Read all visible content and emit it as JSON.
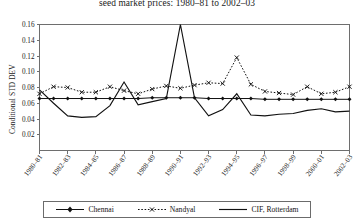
{
  "chart_data": {
    "type": "line",
    "title": "seed market prices: 1980–81 to 2002–03",
    "title_note": "top line of title cropped above image edge",
    "xlabel": "",
    "ylabel": "Conditional STD DEV",
    "ylim": [
      0.0,
      0.16
    ],
    "yticks": [
      0.02,
      0.04,
      0.06,
      0.08,
      0.1,
      0.12,
      0.14,
      0.16
    ],
    "ytick_labels": [
      "0.02",
      "0.04",
      "0.06",
      "0.08",
      "0.10",
      "0.12",
      "0.14",
      "0.16"
    ],
    "grid": false,
    "legend_position": "bottom",
    "x": [
      "1980–81",
      "1981–82",
      "1982–83",
      "1983–84",
      "1984–85",
      "1985–86",
      "1986–87",
      "1987–88",
      "1988–89",
      "1989–90",
      "1990–91",
      "1991–92",
      "1992–93",
      "1993–94",
      "1994–95",
      "1995–96",
      "1996–97",
      "1997–98",
      "1998–99",
      "1999–00",
      "2000–01",
      "2001–02",
      "2002–03"
    ],
    "xtick_labels": [
      "1980–81",
      "1982–83",
      "1984–85",
      "1986–87",
      "1988–89",
      "1990–91",
      "1992–93",
      "1994–95",
      "1996–97",
      "1998–99",
      "2000–01",
      "2002–03"
    ],
    "series": [
      {
        "name": "Chennai",
        "style": "solid-diamond",
        "values": [
          0.066,
          0.066,
          0.066,
          0.066,
          0.066,
          0.066,
          0.066,
          0.066,
          0.067,
          0.067,
          0.067,
          0.067,
          0.066,
          0.066,
          0.066,
          0.066,
          0.065,
          0.065,
          0.065,
          0.065,
          0.065,
          0.065,
          0.065
        ]
      },
      {
        "name": "Nandyal",
        "style": "dotted-x",
        "values": [
          0.072,
          0.081,
          0.08,
          0.074,
          0.074,
          0.081,
          0.076,
          0.072,
          0.078,
          0.082,
          0.079,
          0.083,
          0.086,
          0.085,
          0.118,
          0.084,
          0.075,
          0.073,
          0.071,
          0.081,
          0.072,
          0.074,
          0.081
        ]
      },
      {
        "name": "CIF, Rotterdam",
        "style": "solid-plain",
        "values": [
          0.077,
          0.06,
          0.044,
          0.042,
          0.043,
          0.057,
          0.087,
          0.058,
          0.062,
          0.066,
          0.16,
          0.067,
          0.044,
          0.052,
          0.072,
          0.045,
          0.044,
          0.046,
          0.047,
          0.051,
          0.053,
          0.049,
          0.05
        ]
      }
    ]
  },
  "legend": {
    "items": [
      {
        "label": "Chennai"
      },
      {
        "label": "Nandyal"
      },
      {
        "label": "CIF, Rotterdam"
      }
    ]
  },
  "colors": {
    "line": "#111111",
    "axis": "#6e6e6e",
    "text": "#1a1a1a",
    "background": "#ffffff"
  }
}
